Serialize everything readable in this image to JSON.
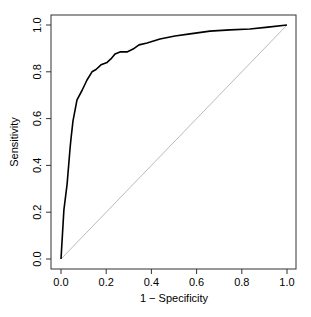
{
  "chart_data": {
    "type": "line",
    "title": "",
    "xlabel": "1 − Specificity",
    "ylabel": "Sensitivity",
    "xlim": [
      0,
      1
    ],
    "ylim": [
      0,
      1
    ],
    "grid": false,
    "legend": null,
    "x_ticks": [
      "0.0",
      "0.2",
      "0.4",
      "0.6",
      "0.8",
      "1.0"
    ],
    "y_ticks": [
      "0.0",
      "0.2",
      "0.4",
      "0.6",
      "0.8",
      "1.0"
    ],
    "series": [
      {
        "name": "ROC curve",
        "color": "#000000",
        "x": [
          0.0,
          0.013,
          0.027,
          0.04,
          0.044,
          0.053,
          0.071,
          0.093,
          0.115,
          0.137,
          0.155,
          0.177,
          0.204,
          0.221,
          0.239,
          0.261,
          0.292,
          0.319,
          0.345,
          0.381,
          0.438,
          0.504,
          0.571,
          0.659,
          0.748,
          0.836,
          0.916,
          1.0
        ],
        "y": [
          0.0,
          0.21,
          0.32,
          0.47,
          0.51,
          0.59,
          0.68,
          0.72,
          0.765,
          0.8,
          0.81,
          0.83,
          0.84,
          0.855,
          0.876,
          0.885,
          0.885,
          0.897,
          0.915,
          0.923,
          0.94,
          0.953,
          0.962,
          0.974,
          0.979,
          0.983,
          0.991,
          1.0
        ]
      },
      {
        "name": "Chance (diagonal reference)",
        "color": "#bbbbbb",
        "x": [
          0,
          1
        ],
        "y": [
          0,
          1
        ]
      }
    ]
  }
}
